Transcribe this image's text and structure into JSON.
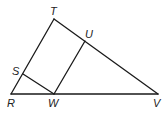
{
  "diagram": {
    "labels": {
      "T": "T",
      "U": "U",
      "S": "S",
      "R": "R",
      "W": "W",
      "V": "V"
    },
    "points": {
      "T": [
        54,
        19
      ],
      "U": [
        85,
        41
      ],
      "S": [
        23,
        74
      ],
      "R": [
        11,
        94
      ],
      "W": [
        54,
        94
      ],
      "V": [
        158,
        94
      ]
    },
    "segments": [
      "RT",
      "TV",
      "RV",
      "SW",
      "WU"
    ],
    "line_color": "#1a1a1a"
  }
}
